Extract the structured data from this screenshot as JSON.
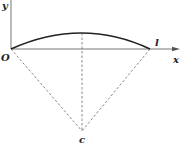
{
  "diagram": {
    "labels": {
      "y_axis": "y",
      "x_axis": "x",
      "origin": "O",
      "endpoint": "l",
      "center": "c"
    },
    "colors": {
      "axis": "#555555",
      "arc": "#222222",
      "dashed": "#555555",
      "text": "#222222"
    }
  }
}
